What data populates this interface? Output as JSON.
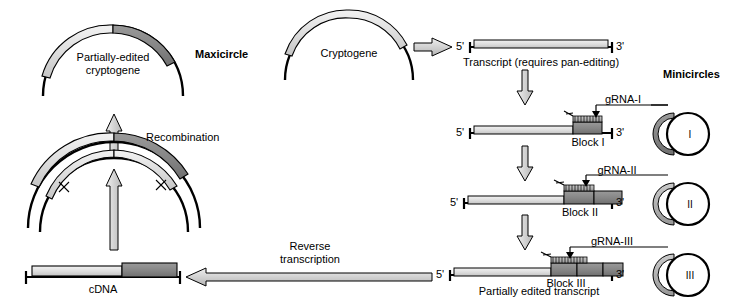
{
  "figure": {
    "title_maxicircle": "Maxicircle",
    "title_minicircles": "Minicircles"
  },
  "labels": {
    "partially_edited_cryptogene_line1": "Partially-edited",
    "partially_edited_cryptogene_line2": "cryptogene",
    "recombination": "Recombination",
    "cryptogene": "Cryptogene",
    "transcript": "Transcript (requires pan-editing)",
    "cdna": "cDNA",
    "reverse_transcription_line1": "Reverse",
    "reverse_transcription_line2": "transcription",
    "partially_edited_transcript": "Partially edited transcript",
    "block_i": "Block I",
    "block_ii": "Block II",
    "block_iii": "Block III",
    "grna_i": "gRNA-I",
    "grna_ii": "gRNA-II",
    "grna_iii": "gRNA-III",
    "five_prime": "5'",
    "three_prime": "3'",
    "minicircle_i": "I",
    "minicircle_ii": "II",
    "minicircle_iii": "III"
  },
  "colors": {
    "stroke": "#000000",
    "light_gray": "#d9d9d9",
    "mid_gray": "#b3b3b3",
    "dark_gray": "#808080",
    "arrow_fill": "#c8c8c8",
    "background": "#ffffff"
  },
  "icons": {
    "maxicircle_arc": "maxicircle-arc-icon",
    "minicircle_circle": "minicircle-circle-icon",
    "block_arrow_up": "block-arrow-up-icon",
    "block_arrow_down": "block-arrow-down-icon",
    "block_arrow_right": "block-arrow-right-icon",
    "block_arrow_left": "block-arrow-left-icon",
    "crossover_x": "crossover-x-icon",
    "grna_pointer": "grna-pointer-arrow-icon"
  }
}
